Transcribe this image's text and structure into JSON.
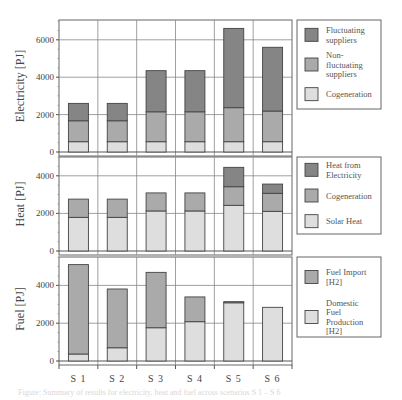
{
  "chart_data": [
    {
      "type": "bar",
      "stacked": true,
      "title": "",
      "ylabel": "Electricity [PJ]",
      "xlabel": "",
      "categories": [
        "S 1",
        "S 2",
        "S 3",
        "S 4",
        "S 5",
        "S 6"
      ],
      "ylim": [
        0,
        7000
      ],
      "yticks": [
        0,
        2000,
        4000,
        6000
      ],
      "grid": true,
      "legend_position": "right",
      "series": [
        {
          "name": "Cogeneration",
          "color": "#dedede",
          "values": [
            550,
            550,
            550,
            550,
            550,
            550
          ]
        },
        {
          "name": "Non-fluctuating suppliers",
          "color": "#aaaaaa",
          "values": [
            1120,
            1120,
            1600,
            1600,
            1820,
            1640
          ]
        },
        {
          "name": "Fluctuating suppliers",
          "color": "#858585",
          "values": [
            930,
            930,
            2200,
            2200,
            4240,
            3410
          ]
        }
      ],
      "legend": [
        {
          "label_lines": [
            "Fluctuating",
            "suppliers"
          ],
          "color": "#858585"
        },
        {
          "label_lines": [
            "Non-",
            "fluctuating",
            "suppliers"
          ],
          "color": "#aaaaaa"
        },
        {
          "label_lines": [
            "Cogeneration"
          ],
          "color": "#dedede"
        }
      ]
    },
    {
      "type": "bar",
      "stacked": true,
      "title": "",
      "ylabel": "Heat [PJ]",
      "xlabel": "",
      "categories": [
        "S 1",
        "S 2",
        "S 3",
        "S 4",
        "S 5",
        "S 6"
      ],
      "ylim": [
        0,
        5000
      ],
      "yticks": [
        0,
        2000,
        4000
      ],
      "grid": true,
      "legend_position": "right",
      "series": [
        {
          "name": "Solar Heat",
          "color": "#dedede",
          "values": [
            1790,
            1790,
            2130,
            2130,
            2430,
            2110
          ]
        },
        {
          "name": "Cogeneration",
          "color": "#aaaaaa",
          "values": [
            970,
            970,
            960,
            960,
            990,
            960
          ]
        },
        {
          "name": "Heat from Electricity",
          "color": "#858585",
          "values": [
            0,
            0,
            0,
            0,
            1030,
            490
          ]
        }
      ],
      "legend": [
        {
          "label_lines": [
            "Heat from",
            "Electricity"
          ],
          "color": "#858585"
        },
        {
          "label_lines": [
            "Cogeneration"
          ],
          "color": "#aaaaaa"
        },
        {
          "label_lines": [
            "Solar Heat"
          ],
          "color": "#dedede"
        }
      ]
    },
    {
      "type": "bar",
      "stacked": true,
      "title": "",
      "ylabel": "Fuel [PJ]",
      "xlabel": "",
      "categories": [
        "S 1",
        "S 2",
        "S 3",
        "S 4",
        "S 5",
        "S 6"
      ],
      "ylim": [
        0,
        5500
      ],
      "yticks": [
        0,
        2000,
        4000
      ],
      "grid": true,
      "legend_position": "right",
      "series": [
        {
          "name": "Domestic Fuel Production [H2]",
          "color": "#dedede",
          "values": [
            370,
            700,
            1760,
            2080,
            3080,
            2840
          ]
        },
        {
          "name": "Fuel Import [H2]",
          "color": "#aaaaaa",
          "values": [
            4730,
            3110,
            2930,
            1310,
            60,
            0
          ]
        }
      ],
      "legend": [
        {
          "label_lines": [
            "Fuel Import",
            "[H2]"
          ],
          "color": "#aaaaaa"
        },
        {
          "label_lines": [
            "Domestic",
            "Fuel",
            "Production",
            "[H2]"
          ],
          "color": "#dedede"
        }
      ]
    }
  ],
  "layout": {
    "plot_left": 59,
    "plot_right": 292,
    "panels": [
      {
        "top": 20,
        "zero_y": 152,
        "px_per_unit": 0.0187,
        "legend": {
          "x": 297,
          "y": 20,
          "w": 84,
          "h": 89
        }
      },
      {
        "top": 157,
        "zero_y": 251,
        "px_per_unit": 0.0188,
        "legend": {
          "x": 297,
          "y": 157,
          "w": 84,
          "h": 77
        }
      },
      {
        "top": 257,
        "zero_y": 361,
        "px_per_unit": 0.0189,
        "legend": {
          "x": 297,
          "y": 257,
          "w": 84,
          "h": 80
        }
      }
    ],
    "bar_width": 20
  },
  "caption": "Figure: Summary of results for electricity, heat and fuel across scenarios S 1 – S 6"
}
